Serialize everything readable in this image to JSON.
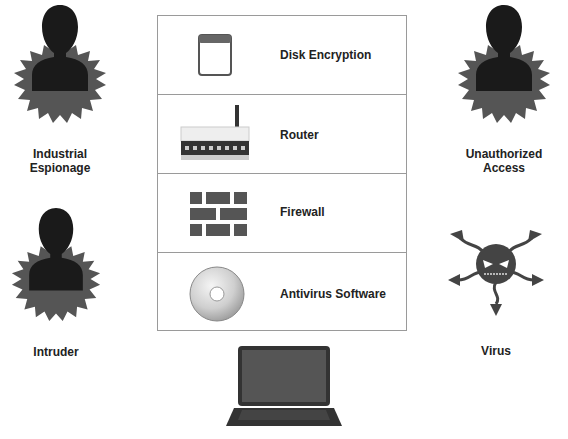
{
  "threats": [
    {
      "id": "industrial-espionage",
      "label_lines": [
        "Industrial",
        "Espionage"
      ],
      "icon": "person-burst-icon"
    },
    {
      "id": "unauthorized-access",
      "label_lines": [
        "Unauthorized",
        "Access"
      ],
      "icon": "person-burst-icon"
    },
    {
      "id": "intruder",
      "label_lines": [
        "Intruder"
      ],
      "icon": "person-burst-icon"
    },
    {
      "id": "virus",
      "label_lines": [
        "Virus"
      ],
      "icon": "virus-icon"
    }
  ],
  "defenses": [
    {
      "label": "Disk Encryption",
      "icon": "window-icon"
    },
    {
      "label": "Router",
      "icon": "router-icon"
    },
    {
      "label": "Firewall",
      "icon": "brick-wall-icon"
    },
    {
      "label": "Antivirus Software",
      "icon": "cd-disc-icon"
    }
  ],
  "protected_asset": {
    "icon": "laptop-icon"
  },
  "colors": {
    "silhouette": "#1a1a1a",
    "burst": "#555555",
    "border": "#9a9a9a",
    "brick": "#555555"
  }
}
